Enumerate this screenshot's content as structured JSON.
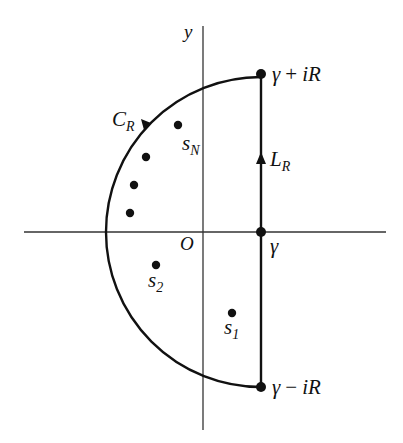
{
  "diagram": {
    "type": "contour-integration",
    "colors": {
      "ink": "#111111",
      "axis": "#333333",
      "background": "#ffffff"
    },
    "axes": {
      "y_label": "y",
      "origin_label": "O"
    },
    "contour": {
      "arc_label": "C",
      "arc_label_sub": "R",
      "line_label": "L",
      "line_label_sub": "R"
    },
    "points": {
      "gamma_label": "γ",
      "top_label_gamma": "γ",
      "top_label_op": "+",
      "top_label_rest": "iR",
      "bottom_label_gamma": "γ",
      "bottom_label_op": "−",
      "bottom_label_rest": "iR"
    },
    "singularities": [
      {
        "label": "s",
        "sub": "N"
      },
      {
        "label": "",
        "sub": ""
      },
      {
        "label": "",
        "sub": ""
      },
      {
        "label": "",
        "sub": ""
      },
      {
        "label": "s",
        "sub": "2"
      },
      {
        "label": "s",
        "sub": "1"
      }
    ]
  }
}
